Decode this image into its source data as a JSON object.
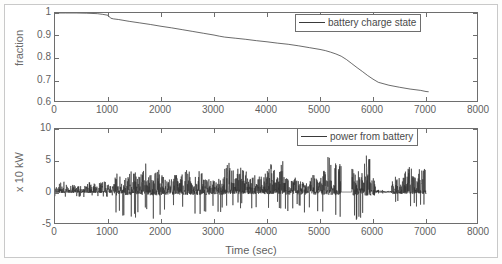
{
  "figure": {
    "xlabel": "Time (sec)",
    "background": "#ffffff",
    "line_color": "#2b2b2b"
  },
  "chart_data": [
    {
      "type": "line",
      "title": "",
      "panel": "top",
      "xlabel": "Time (sec)",
      "ylabel": "fraction",
      "xlim": [
        0,
        8000
      ],
      "ylim": [
        0.6,
        1.0
      ],
      "xticks": [
        0,
        1000,
        2000,
        3000,
        4000,
        5000,
        6000,
        7000,
        8000
      ],
      "xticklabels": [
        "0",
        "1000",
        "2000",
        "3000",
        "4000",
        "5000",
        "6000",
        "7000",
        "8000"
      ],
      "yticks": [
        0.6,
        0.7,
        0.8,
        0.9,
        1.0
      ],
      "yticklabels": [
        "0.6",
        "0.7",
        "0.8",
        "0.9",
        "1"
      ],
      "grid": false,
      "legend": {
        "position": "top-right",
        "entries": [
          "battery charge state"
        ]
      },
      "series": [
        {
          "name": "battery charge state",
          "x": [
            0,
            200,
            400,
            600,
            800,
            900,
            1000,
            1050,
            1100,
            1200,
            1400,
            1600,
            1800,
            2000,
            2200,
            2400,
            2600,
            2800,
            3000,
            3100,
            3200,
            3400,
            3600,
            3800,
            4000,
            4200,
            4400,
            4600,
            4800,
            5000,
            5100,
            5200,
            5300,
            5400,
            5500,
            5600,
            5700,
            5800,
            5900,
            6000,
            6100,
            6300,
            6500,
            6700,
            6900,
            7000,
            7050
          ],
          "y": [
            1.0,
            1.0,
            1.0,
            0.999,
            0.997,
            0.994,
            0.99,
            0.977,
            0.974,
            0.971,
            0.963,
            0.956,
            0.949,
            0.941,
            0.934,
            0.926,
            0.918,
            0.91,
            0.902,
            0.897,
            0.893,
            0.888,
            0.883,
            0.877,
            0.872,
            0.866,
            0.861,
            0.854,
            0.846,
            0.838,
            0.833,
            0.826,
            0.818,
            0.808,
            0.793,
            0.775,
            0.757,
            0.74,
            0.722,
            0.706,
            0.692,
            0.679,
            0.67,
            0.662,
            0.656,
            0.651,
            0.65
          ]
        }
      ]
    },
    {
      "type": "line",
      "title": "",
      "panel": "bottom",
      "xlabel": "Time (sec)",
      "ylabel": "x 10 kW",
      "xlim": [
        0,
        8000
      ],
      "ylim": [
        -5,
        10
      ],
      "xticks": [
        0,
        1000,
        2000,
        3000,
        4000,
        5000,
        6000,
        7000,
        8000
      ],
      "xticklabels": [
        "0",
        "1000",
        "2000",
        "3000",
        "4000",
        "5000",
        "6000",
        "7000",
        "8000"
      ],
      "yticks": [
        -5,
        0,
        5,
        10
      ],
      "yticklabels": [
        "-5",
        "0",
        "5",
        "10"
      ],
      "grid": false,
      "legend": {
        "position": "top-right",
        "entries": [
          "power from battery"
        ]
      },
      "series": [
        {
          "name": "power from battery",
          "description": "High-frequency oscillating battery power trace; baseline near 0, positive spikes to ~5-7, negative excursions to ~-4, data ends near 7000 s with a flat segment near 5400-5600 s",
          "x_range": [
            0,
            7000
          ],
          "baseline": 0,
          "typical_positive_peak": 2.5,
          "max_positive_peak": 7.0,
          "max_negative_peak": -4.3,
          "segments": [
            {
              "t_start": 0,
              "t_end": 1100,
              "amp_pos": 2.0,
              "amp_neg": -0.8,
              "density": "moderate"
            },
            {
              "t_start": 1100,
              "t_end": 2050,
              "amp_pos": 4.6,
              "amp_neg": -4.2,
              "density": "high"
            },
            {
              "t_start": 2050,
              "t_end": 3200,
              "amp_pos": 4.2,
              "amp_neg": -3.4,
              "density": "high"
            },
            {
              "t_start": 3200,
              "t_end": 4300,
              "amp_pos": 5.0,
              "amp_neg": -2.6,
              "density": "high"
            },
            {
              "t_start": 4300,
              "t_end": 5150,
              "amp_pos": 3.6,
              "amp_neg": -3.2,
              "density": "high"
            },
            {
              "t_start": 5150,
              "t_end": 5400,
              "amp_pos": 6.8,
              "amp_neg": -4.3,
              "density": "high"
            },
            {
              "t_start": 5400,
              "t_end": 5600,
              "amp_pos": 0.5,
              "amp_neg": 0.0,
              "density": "flat"
            },
            {
              "t_start": 5600,
              "t_end": 6050,
              "amp_pos": 6.0,
              "amp_neg": -4.3,
              "density": "high"
            },
            {
              "t_start": 6050,
              "t_end": 6350,
              "amp_pos": 1.0,
              "amp_neg": -0.6,
              "density": "low"
            },
            {
              "t_start": 6350,
              "t_end": 7000,
              "amp_pos": 4.4,
              "amp_neg": -2.4,
              "density": "high"
            }
          ]
        }
      ]
    }
  ]
}
